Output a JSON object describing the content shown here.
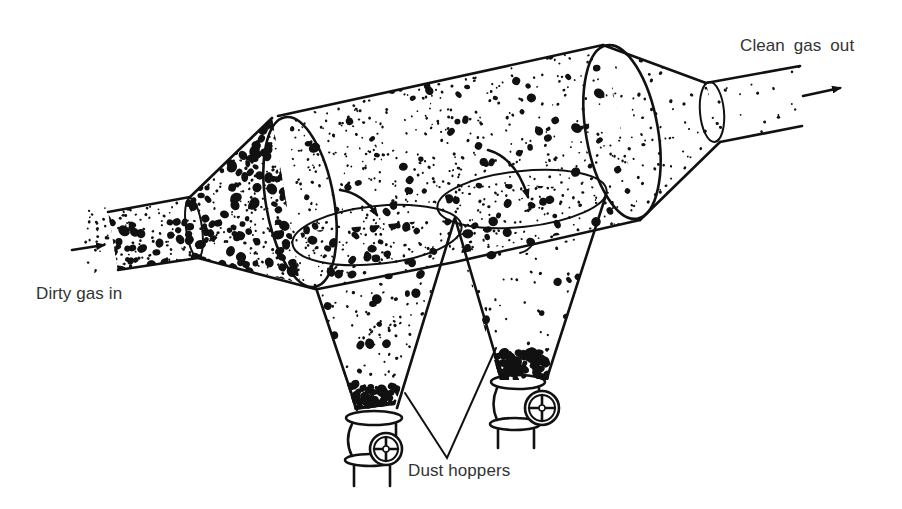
{
  "diagram": {
    "type": "gravity settling chamber with dust hoppers",
    "labels": {
      "gas_outlet": "Clean  gas out",
      "gas_inlet": "Dirty gas in",
      "hoppers": "Dust hoppers"
    },
    "components": [
      "inlet-duct",
      "inlet-transition-cone",
      "settling-chamber-cylinder",
      "baffle-plate-1",
      "baffle-plate-2",
      "dust-hopper-1",
      "dust-hopper-2",
      "discharge-valve-1",
      "discharge-valve-2",
      "outlet-transition-cone",
      "outlet-duct"
    ],
    "arrows": [
      {
        "name": "inlet-flow-arrow",
        "direction": "right"
      },
      {
        "name": "outlet-flow-arrow",
        "direction": "right"
      },
      {
        "name": "deflection-arrow-1",
        "direction": "down-right"
      },
      {
        "name": "deflection-arrow-2",
        "direction": "down-right"
      }
    ],
    "colors": {
      "ink": "#111111",
      "label_text": "#333333",
      "background": "#ffffff"
    }
  }
}
